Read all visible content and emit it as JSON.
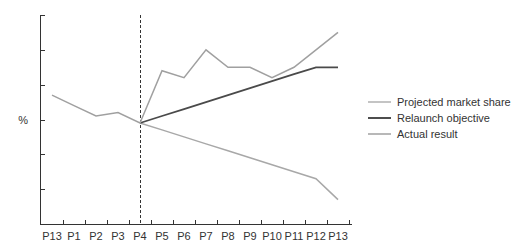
{
  "chart_data": {
    "type": "line",
    "title": "",
    "xlabel": "",
    "ylabel": "%",
    "categories": [
      "P13",
      "P1",
      "P2",
      "P3",
      "P4",
      "P5",
      "P6",
      "P7",
      "P8",
      "P9",
      "P10",
      "P11",
      "P12",
      "P13"
    ],
    "ylim": [
      0,
      6
    ],
    "y_ticks_unlabeled": 6,
    "grid": false,
    "legend_position": "right",
    "annotations": [
      {
        "type": "vertical-dashed-line",
        "at": "P4"
      }
    ],
    "series": [
      {
        "name": "Projected market share",
        "color": "#a8a8a8",
        "values": [
          null,
          null,
          null,
          null,
          2.9,
          2.7,
          2.5,
          2.3,
          2.1,
          1.9,
          1.7,
          1.5,
          1.3,
          0.7
        ]
      },
      {
        "name": "Relaunch objective",
        "color": "#4a4a4a",
        "values": [
          null,
          null,
          null,
          null,
          2.9,
          3.1,
          3.3,
          3.5,
          3.7,
          3.9,
          4.1,
          4.3,
          4.5,
          4.5
        ]
      },
      {
        "name": "Actual result",
        "color": "#a0a0a0",
        "values": [
          3.7,
          3.4,
          3.1,
          3.2,
          2.9,
          4.4,
          4.2,
          5.0,
          4.5,
          4.5,
          4.2,
          4.5,
          5.0,
          5.5
        ]
      }
    ]
  },
  "legend": {
    "items": [
      {
        "label": "Projected market share",
        "color": "#b0b0b0"
      },
      {
        "label": "Relaunch objective",
        "color": "#3a3a3a"
      },
      {
        "label": "Actual result",
        "color": "#a0a0a0"
      }
    ]
  },
  "axis": {
    "y_label": "%"
  }
}
